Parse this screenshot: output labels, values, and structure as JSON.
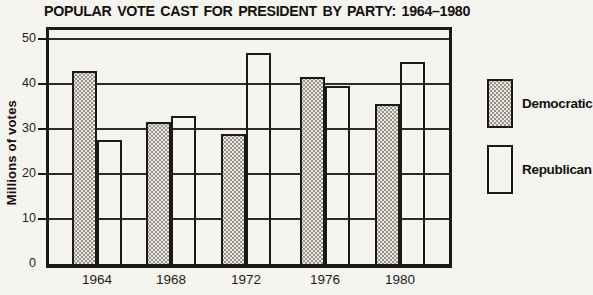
{
  "chart_data": {
    "type": "bar",
    "title": "POPULAR VOTE CAST FOR PRESIDENT BY PARTY: 1964–1980",
    "categories": [
      "1964",
      "1968",
      "1972",
      "1976",
      "1980"
    ],
    "series": [
      {
        "name": "Democratic",
        "pattern": "dotted-halftone",
        "values": [
          43,
          31.5,
          29,
          41.5,
          35.5
        ]
      },
      {
        "name": "Republican",
        "pattern": "white-outline",
        "values": [
          27.5,
          33,
          47,
          39.5,
          45
        ]
      }
    ],
    "xlabel": "",
    "ylabel": "Millions of votes",
    "yticks": [
      0,
      10,
      20,
      30,
      40,
      50
    ],
    "ylim": [
      0,
      52
    ],
    "grid": "horizontal",
    "legend_position": "right",
    "units": "millions of votes"
  },
  "colors": {
    "paper": "#f6f4ee",
    "ink": "#1a1a1a",
    "pattern_dot": "#97938a",
    "pattern_base": "#ebe8e1"
  }
}
